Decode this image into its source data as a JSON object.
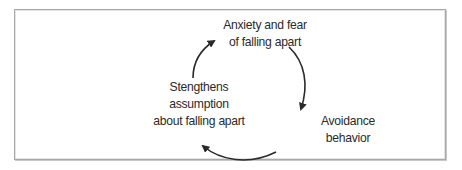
{
  "diagram": {
    "type": "cycle",
    "direction": "clockwise",
    "nodes": [
      {
        "id": "top",
        "label": "Anxiety and fear\nof falling apart"
      },
      {
        "id": "right",
        "label": "Avoidance\nbehavior"
      },
      {
        "id": "left",
        "label": "Stengthens\nassumption\nabout falling apart"
      }
    ],
    "edges": [
      {
        "from": "top",
        "to": "right"
      },
      {
        "from": "right",
        "to": "left"
      },
      {
        "from": "left",
        "to": "top"
      }
    ],
    "colors": {
      "text": "#2a2a2a",
      "arrow": "#2a2a2a",
      "frame": "#a8a8a8",
      "background": "#ffffff"
    }
  }
}
